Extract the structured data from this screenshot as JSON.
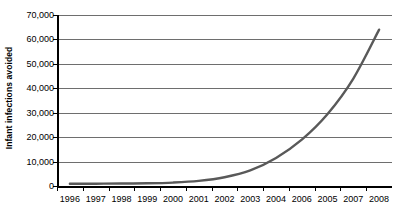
{
  "chart_data": {
    "type": "line",
    "title": "",
    "xlabel": "",
    "ylabel": "Infant infections avoided",
    "ylim": [
      0,
      70000
    ],
    "ytick_labels": [
      "0",
      "10,000",
      "20,000",
      "30,000",
      "40,000",
      "50,000",
      "60,000",
      "70,000"
    ],
    "ytick_values": [
      0,
      10000,
      20000,
      30000,
      40000,
      50000,
      60000,
      70000
    ],
    "grid": true,
    "legend": "none",
    "categories": [
      "1996",
      "1997",
      "1998",
      "1999",
      "2000",
      "2001",
      "2002",
      "2003",
      "2004",
      "2006",
      "2005",
      "2007",
      "2008"
    ],
    "series": [
      {
        "name": "Infant infections avoided",
        "color": "#595959",
        "values": [
          900,
          950,
          1000,
          1100,
          1400,
          2100,
          3600,
          6400,
          11500,
          19000,
          29500,
          44000,
          64000
        ]
      }
    ]
  }
}
